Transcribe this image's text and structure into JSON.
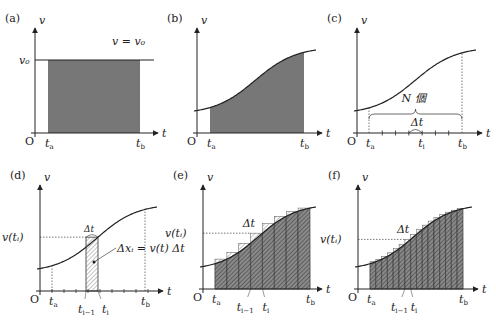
{
  "figure": {
    "colors": {
      "fill": "#777777",
      "stroke": "#222222",
      "hatch": "#222222",
      "dotted": "#555555",
      "light": "#bbbbbb"
    },
    "panels": [
      {
        "id": "a",
        "label": "(a)",
        "y_label": "v",
        "x_label": "t",
        "origin": "O",
        "type": "constant",
        "axis": {
          "x0": 35,
          "y0": 133,
          "x_end": 158,
          "y_top": 28
        },
        "v0_y": 60,
        "ta": 48,
        "tb": 140,
        "line_label": "v = v₀",
        "v0_label": "v₀",
        "ta_label": "t",
        "ta_sub": "a",
        "tb_label": "t",
        "tb_sub": "b"
      },
      {
        "id": "b",
        "label": "(b)",
        "y_label": "v",
        "x_label": "t",
        "origin": "O",
        "type": "area",
        "axis": {
          "x0": 197,
          "y0": 133,
          "x_end": 322,
          "y_top": 28
        },
        "ta": 210,
        "tb": 304,
        "ta_label": "t",
        "ta_sub": "a",
        "tb_label": "t",
        "tb_sub": "b"
      },
      {
        "id": "c",
        "label": "(c)",
        "y_label": "v",
        "x_label": "t",
        "origin": "O",
        "type": "partition",
        "axis": {
          "x0": 357,
          "y0": 133,
          "x_end": 482,
          "y_top": 28
        },
        "ta": 369,
        "tb": 462,
        "n_ticks": 7,
        "brace_label": "N 個",
        "dt_label": "Δt",
        "ta_label": "t",
        "ta_sub": "a",
        "ti_label": "t",
        "ti_sub": "i",
        "tb_label": "t",
        "tb_sub": "b"
      },
      {
        "id": "d",
        "label": "(d)",
        "y_label": "v",
        "x_label": "t",
        "origin": "O",
        "type": "single-strip",
        "axis": {
          "x0": 40,
          "y0": 291,
          "x_end": 163,
          "y_top": 185
        },
        "ta": 52,
        "tb": 145,
        "strip_left": 86,
        "strip_right": 98,
        "vti_label": "v(tᵢ)",
        "dt_label": "Δt",
        "dx_label": "Δxᵢ = v(t) Δt",
        "ta_label": "t",
        "ta_sub": "a",
        "ti1_label": "t",
        "ti1_sub": "i−1",
        "ti_label": "t",
        "ti_sub": "i",
        "tb_label": "t",
        "tb_sub": "b"
      },
      {
        "id": "e",
        "label": "(e)",
        "y_label": "v",
        "x_label": "t",
        "origin": "O",
        "type": "riemann",
        "axis": {
          "x0": 203,
          "y0": 289,
          "x_end": 322,
          "y_top": 185
        },
        "ta": 215,
        "tb": 310,
        "n_strips": 8,
        "vti_label": "v(tᵢ)",
        "dt_label": "Δt",
        "ta_label": "t",
        "ta_sub": "a",
        "ti1_label": "t",
        "ti1_sub": "i−1",
        "ti_label": "t",
        "ti_sub": "i",
        "tb_label": "t",
        "tb_sub": "b"
      },
      {
        "id": "f",
        "label": "(f)",
        "y_label": "v",
        "x_label": "t",
        "origin": "O",
        "type": "riemann",
        "axis": {
          "x0": 358,
          "y0": 289,
          "x_end": 478,
          "y_top": 185
        },
        "ta": 370,
        "tb": 463,
        "n_strips": 16,
        "vti_label": "v(tᵢ)",
        "dt_label": "Δt",
        "ta_label": "t",
        "ta_sub": "a",
        "ti1_label": "t",
        "ti1_sub": "i−1",
        "ti_label": "t",
        "ti_sub": "i",
        "tb_label": "t",
        "tb_sub": "b"
      }
    ]
  }
}
